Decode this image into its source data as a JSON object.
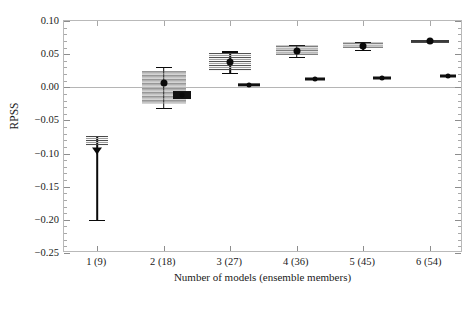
{
  "chart_data": {
    "type": "scatter",
    "title": "",
    "xlabel": "Number of models (ensemble members)",
    "ylabel": "RPSS",
    "categories": [
      "1 (9)",
      "2 (18)",
      "3 (27)",
      "4 (36)",
      "5 (45)",
      "6 (54)"
    ],
    "x_positions": [
      1,
      2,
      3,
      4,
      5,
      6
    ],
    "xlim": [
      0.5,
      6.5
    ],
    "ylim": [
      -0.25,
      0.1
    ],
    "y_ticks": [
      0.1,
      0.05,
      0.0,
      -0.05,
      -0.1,
      -0.15,
      -0.2,
      -0.25
    ],
    "y_tick_labels": [
      "0.10",
      "0.05",
      "0.00",
      "-0.05",
      "-0.10",
      "-0.15",
      "-0.20",
      "-0.25"
    ],
    "y_minor_tick_step": 0.01,
    "grid": false,
    "zero_reference_line": 0.0,
    "legend": "none",
    "series": [
      {
        "name": "ensemble mean RPSS (with spread band and error bar)",
        "marker": "filled-circle-or-triangle",
        "points": [
          {
            "x": 1,
            "category": "1 (9)",
            "value": -0.096,
            "marker": "triangle-down",
            "err_low": -0.2,
            "err_high": -0.073,
            "band_low": -0.088,
            "band_high": -0.073,
            "band_halfwidth_px": 11
          },
          {
            "x": 2,
            "category": "2 (18)",
            "value": 0.006,
            "marker": "circle",
            "err_low": -0.031,
            "err_high": 0.031,
            "band_low": -0.026,
            "band_high": 0.024,
            "band_halfwidth_px": 22
          },
          {
            "x": 3,
            "category": "3 (27)",
            "value": 0.038,
            "marker": "circle",
            "err_low": 0.022,
            "err_high": 0.054,
            "band_low": 0.024,
            "band_high": 0.051,
            "band_halfwidth_px": 21
          },
          {
            "x": 4,
            "category": "4 (36)",
            "value": 0.055,
            "marker": "circle",
            "err_low": 0.046,
            "err_high": 0.064,
            "band_low": 0.047,
            "band_high": 0.063,
            "band_halfwidth_px": 21
          },
          {
            "x": 5,
            "category": "5 (45)",
            "value": 0.063,
            "marker": "circle",
            "err_low": 0.057,
            "err_high": 0.069,
            "band_low": 0.058,
            "band_high": 0.068,
            "band_halfwidth_px": 20
          },
          {
            "x": 6,
            "category": "6 (54)",
            "value": 0.07,
            "marker": "circle",
            "err_low": 0.07,
            "err_high": 0.07,
            "band_low": 0.07,
            "band_high": 0.07,
            "band_halfwidth_px": 19
          }
        ]
      },
      {
        "name": "reference RPSS (small offset marker)",
        "marker": "small-filled-bar",
        "points": [
          {
            "x": 2.28,
            "category": "2 (18)",
            "value": -0.011,
            "err_low": -0.017,
            "err_high": -0.005,
            "halfwidth_px": 9
          },
          {
            "x": 3.28,
            "category": "3 (27)",
            "value": 0.004,
            "err_low": 0.002,
            "err_high": 0.007,
            "halfwidth_px": 11
          },
          {
            "x": 4.28,
            "category": "4 (36)",
            "value": 0.012,
            "err_low": 0.01,
            "err_high": 0.014,
            "halfwidth_px": 10
          },
          {
            "x": 5.28,
            "category": "5 (45)",
            "value": 0.014,
            "err_low": 0.012,
            "err_high": 0.016,
            "halfwidth_px": 9
          },
          {
            "x": 6.28,
            "category": "6 (54)",
            "value": 0.017,
            "err_low": 0.016,
            "err_high": 0.018,
            "halfwidth_px": 8
          }
        ]
      }
    ],
    "colors": {
      "marker": "#0a0a0a",
      "band": "#6e6e6e",
      "axis": "#b9b9b9",
      "zero_line": "#b5b5b5",
      "text": "#1a1a1a",
      "background": "#ffffff"
    }
  }
}
